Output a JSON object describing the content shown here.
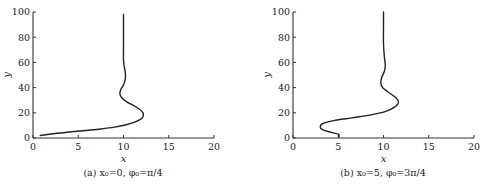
{
  "chart_data": [
    {
      "type": "line",
      "title": "",
      "caption": "(a) x₀=0, φ₀=π/4",
      "xlabel": "x",
      "ylabel": "y",
      "xlim": [
        0,
        20
      ],
      "ylim": [
        0,
        100
      ],
      "xticks": [
        0,
        5,
        10,
        15,
        20
      ],
      "yticks": [
        0,
        20,
        40,
        60,
        80,
        100
      ],
      "grid": false,
      "series": [
        {
          "name": "trajectory",
          "x": [
            0.8,
            3.0,
            5.5,
            7.5,
            9.0,
            10.3,
            11.3,
            12.0,
            12.2,
            12.0,
            11.3,
            10.4,
            9.8,
            9.6,
            9.7,
            10.0,
            10.2,
            10.2,
            10.1,
            10.0,
            10.0,
            10.0,
            10.0
          ],
          "y": [
            2,
            4,
            5.8,
            7.2,
            8.6,
            10.5,
            12.8,
            15.5,
            18.5,
            21.5,
            25,
            28.5,
            32,
            35,
            38.5,
            42,
            47,
            52,
            56,
            62,
            75,
            88,
            98
          ]
        }
      ]
    },
    {
      "type": "line",
      "title": "",
      "caption": "(b) x₀=5, φ₀=3π/4",
      "xlabel": "x",
      "ylabel": "y",
      "xlim": [
        0,
        20
      ],
      "ylim": [
        0,
        100
      ],
      "xticks": [
        0,
        5,
        10,
        15,
        20
      ],
      "yticks": [
        0,
        20,
        40,
        60,
        80,
        100
      ],
      "grid": false,
      "series": [
        {
          "name": "trajectory",
          "x": [
            5.1,
            5.0,
            4.2,
            3.3,
            3.0,
            3.3,
            4.5,
            6.5,
            8.5,
            10.0,
            11.0,
            11.6,
            11.6,
            11.2,
            10.5,
            9.9,
            9.7,
            9.8,
            10.1,
            10.2,
            10.1,
            10.0,
            10.0,
            10.0
          ],
          "y": [
            1,
            3,
            4.5,
            6.5,
            9,
            11.5,
            13.8,
            16,
            18.2,
            20.5,
            23.5,
            27,
            30,
            33,
            36.5,
            40,
            44,
            48,
            53,
            58,
            64,
            75,
            88,
            100
          ]
        }
      ]
    }
  ]
}
